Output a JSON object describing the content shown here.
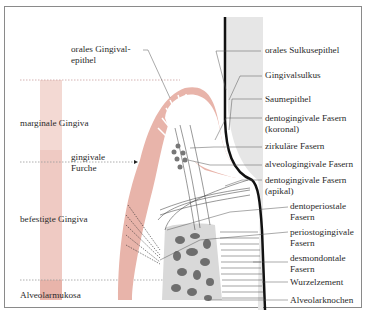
{
  "diagram": {
    "title": "",
    "labels_left": {
      "orales_gingivalepithel": "orales Gingival-\nepithel",
      "marginale_gingiva": "marginale Gingiva",
      "gingivale_furche": "gingivale\nFurche",
      "befestigte_gingiva": "befestigte Gingiva",
      "alveolarmukosa": "Alveolarmukosa"
    },
    "labels_right": [
      {
        "id": "orales-sulkusepithel",
        "text": "orales Sulkusepithel"
      },
      {
        "id": "gingivalsulkus",
        "text": "Gingivalsulkus"
      },
      {
        "id": "saumepithel",
        "text": "Saumepithel"
      },
      {
        "id": "dentogingivale-fasern-koronal",
        "text": "dentogingivale Fasern\n(koronal)"
      },
      {
        "id": "zirkulaere-fasern",
        "text": "zirkuläre Fasern"
      },
      {
        "id": "alveologingivale-fasern",
        "text": "alveologingivale Fasern"
      },
      {
        "id": "dentogingivale-fasern-apikal",
        "text": "dentogingivale Fasern\n(apikal)"
      },
      {
        "id": "dentoperiostale-fasern",
        "text": "dentoperiostale\nFasern"
      },
      {
        "id": "periostogingivale-fasern",
        "text": "periostogingivale\nFasern"
      },
      {
        "id": "desmondontale-fasern",
        "text": "desmondontale\nFasern"
      },
      {
        "id": "wurzelzement",
        "text": "Wurzelzement"
      },
      {
        "id": "alveolarknochen",
        "text": "Alveolarknochen"
      }
    ],
    "colors": {
      "gingiva": "#e8b4aa",
      "gingiva_light": "#f3d9d3",
      "tooth": "#e6e6e6",
      "bone_bg": "#d9d9d9",
      "bone_spots": "#6e6e6e",
      "line": "#333333",
      "frame": "#8a8a8a"
    }
  }
}
